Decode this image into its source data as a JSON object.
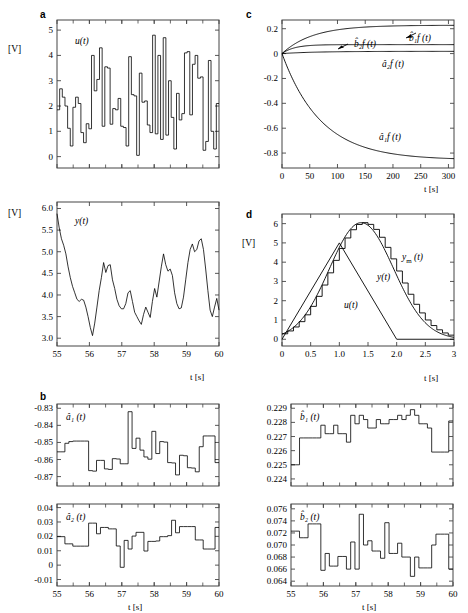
{
  "figure": {
    "panels": [
      "a",
      "b",
      "c",
      "d"
    ],
    "unit_label": "[V]",
    "time_label": "t [s]"
  },
  "panel_a_u": {
    "letter": "a",
    "curve_label": "u(t)",
    "unit": "[V]",
    "yticks": [
      "0",
      "1",
      "2",
      "3",
      "4",
      "5"
    ],
    "xticks": [
      "55",
      "56",
      "57",
      "58",
      "59",
      "60"
    ]
  },
  "panel_a_y": {
    "curve_label": "y(t)",
    "unit": "[V]",
    "yticks": [
      "3.0",
      "3.5",
      "4.0",
      "4.5",
      "5.0",
      "5.5",
      "6.0"
    ],
    "xticks": [
      "55",
      "56",
      "57",
      "58",
      "59",
      "60"
    ],
    "xaxis": "t [s]"
  },
  "panel_b_a1": {
    "letter": "b",
    "curve_label": "â₁ (t)",
    "yticks": [
      "-0.87",
      "-0.86",
      "-0.85",
      "-0.84",
      "-0.83"
    ],
    "xticks": [
      "55",
      "56",
      "57",
      "58",
      "59",
      "60"
    ]
  },
  "panel_b_a2": {
    "curve_label": "â₂ (t)",
    "yticks": [
      "-0.01",
      "0",
      "0.01",
      "0.02",
      "0.03",
      "0.04"
    ],
    "xticks": [
      "55",
      "56",
      "57",
      "58",
      "59",
      "60"
    ],
    "xaxis": "t [s]"
  },
  "panel_b_b1": {
    "curve_label": "b̂₁ (t)",
    "yticks": [
      "0.224",
      "0.225",
      "0.226",
      "0.227",
      "0.228",
      "0.229"
    ],
    "xticks": [
      "55",
      "56",
      "57",
      "58",
      "59",
      "60"
    ]
  },
  "panel_b_b2": {
    "curve_label": "b̂₂ (t)",
    "yticks": [
      "0.064",
      "0.066",
      "0.068",
      "0.070",
      "0.072",
      "0.074",
      "0.076"
    ],
    "xticks": [
      "55",
      "56",
      "57",
      "58",
      "59",
      "60"
    ],
    "xaxis": "t [s]"
  },
  "panel_c": {
    "letter": "c",
    "yticks": [
      "-0.8",
      "-0.6",
      "-0.4",
      "-0.2",
      "0",
      "0.2"
    ],
    "xticks": [
      "0",
      "50",
      "100",
      "150",
      "200",
      "250",
      "300"
    ],
    "xaxis": "t [s]",
    "labels": {
      "b2f": "b̂₂f (t)",
      "b1f": "b̂₁f (t)",
      "a2f": "â₂f (t)",
      "a1f": "â₁f (t)"
    }
  },
  "panel_d": {
    "letter": "d",
    "unit": "[V]",
    "yticks": [
      "0",
      "1",
      "2",
      "3",
      "4",
      "5",
      "6"
    ],
    "xticks": [
      "0",
      "0.5",
      "1.0",
      "1.5",
      "2.0",
      "2.5",
      "3"
    ],
    "xaxis": "t [s]",
    "labels": {
      "ym": "y_m (t)",
      "y": "y(t)",
      "u": "u(t)"
    }
  },
  "chart_data": [
    {
      "id": "a_u",
      "type": "line",
      "title": "u(t) input signal",
      "xlabel": "t [s]",
      "ylabel": "[V]",
      "xlim": [
        55,
        60
      ],
      "ylim": [
        -0.45,
        5.4
      ],
      "grid": false,
      "step": true,
      "values": [
        1.85,
        2.68,
        2.35,
        2.0,
        1.12,
        0.42,
        1.95,
        2.35,
        2.1,
        0.95,
        0.55,
        1.3,
        1.1,
        4.0,
        2.6,
        3.05,
        4.3,
        1.2,
        3.55,
        3.5,
        1.28,
        1.9,
        1.85,
        2.3,
        1.2,
        1.15,
        0.42,
        3.95,
        2.45,
        2.4,
        0.05,
        3.3,
        2.15,
        2.2,
        1.25,
        0.95,
        4.8,
        0.9,
        4.0,
        0.68,
        4.7,
        0.85,
        3.0,
        1.55,
        0.3,
        2.5,
        1.45,
        1.7,
        4.1,
        4.15,
        1.65,
        3.65,
        4.0,
        3.1,
        3.15,
        0.25,
        0.6,
        3.8,
        1.0,
        0.3,
        2.1
      ]
    },
    {
      "id": "a_y",
      "type": "line",
      "title": "y(t) output signal",
      "xlabel": "t [s]",
      "ylabel": "[V]",
      "xlim": [
        55,
        60
      ],
      "ylim": [
        2.82,
        6.15
      ],
      "grid": false,
      "values": [
        5.88,
        5.55,
        5.3,
        5.15,
        4.95,
        4.65,
        4.4,
        4.2,
        4.05,
        3.9,
        3.85,
        3.9,
        3.88,
        3.72,
        3.5,
        3.25,
        3.06,
        3.35,
        3.72,
        4.1,
        4.4,
        4.75,
        4.52,
        4.68,
        4.7,
        4.35,
        4.15,
        3.9,
        3.75,
        3.68,
        3.68,
        3.8,
        4.05,
        4.1,
        3.85,
        3.6,
        3.5,
        3.4,
        3.32,
        3.55,
        3.72,
        3.6,
        3.48,
        3.85,
        4.15,
        3.95,
        4.3,
        4.65,
        4.95,
        4.7,
        4.55,
        4.6,
        4.45,
        4.05,
        3.8,
        3.68,
        3.7,
        3.95,
        4.35,
        4.75,
        5.05,
        5.18,
        5.0,
        5.05,
        5.25,
        5.3,
        5.05,
        4.6,
        4.1,
        3.65,
        3.5,
        3.72,
        3.92,
        3.65
      ]
    },
    {
      "id": "b_a1",
      "type": "line",
      "title": "â₁(t) estimate",
      "xlabel": "t [s]",
      "ylabel": "",
      "xlim": [
        55,
        60
      ],
      "ylim": [
        -0.8755,
        -0.8275
      ],
      "step": true,
      "grid": false,
      "values": [
        -0.8555,
        -0.8555,
        -0.8505,
        -0.8495,
        -0.8492,
        -0.8492,
        -0.8492,
        -0.8492,
        -0.8665,
        -0.8668,
        -0.8605,
        -0.8605,
        -0.8655,
        -0.8658,
        -0.8595,
        -0.8597,
        -0.8625,
        -0.8625,
        -0.832,
        -0.8535,
        -0.8475,
        -0.8545,
        -0.8585,
        -0.8598,
        -0.8435,
        -0.8565,
        -0.8495,
        -0.8498,
        -0.8618,
        -0.862,
        -0.869,
        -0.8575,
        -0.8578,
        -0.8648,
        -0.865,
        -0.8672,
        -0.8525,
        -0.8462,
        -0.8462,
        -0.8462,
        -0.8618
      ]
    },
    {
      "id": "b_a2",
      "type": "line",
      "title": "â₂(t) estimate",
      "xlabel": "t [s]",
      "ylabel": "",
      "xlim": [
        55,
        60
      ],
      "ylim": [
        -0.0145,
        0.0425
      ],
      "step": true,
      "grid": false,
      "values": [
        0.0198,
        0.0198,
        0.0148,
        0.0148,
        0.0132,
        0.0132,
        0.0132,
        0.0132,
        0.0292,
        0.0292,
        0.0218,
        0.0262,
        0.0262,
        0.0252,
        0.0252,
        0.0133,
        -0.0015,
        0.0172,
        0.0112,
        0.0202,
        0.0228,
        0.0228,
        0.0098,
        0.0165,
        0.0165,
        0.0168,
        0.0198,
        0.0198,
        0.0205,
        0.0312,
        0.0225,
        0.0268,
        0.0268,
        0.0268,
        0.0268,
        0.0175,
        0.0175,
        0.0112,
        0.0112,
        0.0112,
        0.0262
      ]
    },
    {
      "id": "b_b1",
      "type": "line",
      "title": "b̂₁(t) estimate",
      "xlabel": "t [s]",
      "ylabel": "",
      "xlim": [
        55,
        60
      ],
      "ylim": [
        0.2235,
        0.2293
      ],
      "step": true,
      "grid": false,
      "values": [
        0.225,
        0.225,
        0.2269,
        0.2269,
        0.2269,
        0.2269,
        0.2269,
        0.2278,
        0.2272,
        0.2272,
        0.2278,
        0.2272,
        0.2272,
        0.2266,
        0.2285,
        0.2279,
        0.2285,
        0.2282,
        0.2276,
        0.2276,
        0.2282,
        0.2279,
        0.2279,
        0.2282,
        0.2282,
        0.2285,
        0.2282,
        0.2285,
        0.2289,
        0.2285,
        0.2279,
        0.2279,
        0.2276,
        0.2259,
        0.2259,
        0.2259,
        0.2259,
        0.2281
      ]
    },
    {
      "id": "b_b2",
      "type": "line",
      "title": "b̂₂(t) estimate",
      "xlabel": "t [s]",
      "ylabel": "",
      "xlim": [
        55,
        60
      ],
      "ylim": [
        0.0632,
        0.0768
      ],
      "step": true,
      "grid": false,
      "values": [
        0.0723,
        0.0723,
        0.0712,
        0.0712,
        0.0735,
        0.0735,
        0.0735,
        0.0658,
        0.0686,
        0.0665,
        0.0665,
        0.0681,
        0.0681,
        0.066,
        0.0705,
        0.066,
        0.0751,
        0.07,
        0.0707,
        0.069,
        0.069,
        0.0678,
        0.0737,
        0.0686,
        0.0686,
        0.0703,
        0.068,
        0.068,
        0.0648,
        0.068,
        0.0662,
        0.0662,
        0.0662,
        0.07,
        0.0718,
        0.0718,
        0.0718,
        0.066
      ]
    },
    {
      "id": "c",
      "type": "line",
      "title": "Filtered parameter estimates convergence",
      "xlabel": "t [s]",
      "ylabel": "",
      "xlim": [
        0,
        310
      ],
      "ylim": [
        -0.92,
        0.27
      ],
      "grid": false,
      "series": [
        {
          "name": "b̂₁f (t)",
          "final": 0.228,
          "tau": 55,
          "start": 0
        },
        {
          "name": "b̂₂f (t)",
          "final": 0.072,
          "tau": 22,
          "start": 0
        },
        {
          "name": "â₂f (t)",
          "final": 0.018,
          "tau": 60,
          "start": 0
        },
        {
          "name": "â₁f (t)",
          "final": -0.855,
          "tau": 70,
          "start": 0
        }
      ]
    },
    {
      "id": "d",
      "type": "line",
      "title": "Triangular input and responses",
      "xlabel": "t [s]",
      "ylabel": "[V]",
      "xlim": [
        0,
        3
      ],
      "ylim": [
        -0.35,
        6.5
      ],
      "grid": false,
      "series": [
        {
          "name": "u(t)",
          "kind": "triangle",
          "peak_x": 1.0,
          "peak_y": 5.0,
          "end_x": 2.0
        },
        {
          "name": "y(t)",
          "kind": "smooth-response",
          "peak_x": 1.38,
          "peak_y": 6.05
        },
        {
          "name": "y_m (t)",
          "kind": "staircase-response",
          "peak_x": 1.45,
          "peak_y": 6.05
        }
      ]
    }
  ]
}
